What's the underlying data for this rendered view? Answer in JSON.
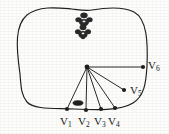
{
  "figure": {
    "kind": "geometry-diagram",
    "background_color": "#fdfdfc",
    "ink_color": "#1f1f1f",
    "outline": {
      "name": "region-outline",
      "path": "M 20 74 C 16 46 15 25 27 15 C 40 5 60 8 72 9 C 80 10 86 11 92 10 C 104 8 122 6 134 12 C 147 19 148 42 147 66 C 146 84 144 96 133 103 C 120 111 96 110 74 109 C 56 108 34 110 27 102 C 21 95 21 86 20 74 Z"
    },
    "hub": {
      "name": "hub-vertex",
      "x": 87,
      "y": 67,
      "radius": 2.4
    },
    "vertices": [
      {
        "id": "V1",
        "label": "V",
        "sub": "1",
        "x": 67,
        "y": 109,
        "label_x": 60,
        "label_y": 116
      },
      {
        "id": "V2",
        "label": "V",
        "sub": "2",
        "x": 86,
        "y": 110,
        "label_x": 78,
        "label_y": 116
      },
      {
        "id": "V3",
        "label": "V",
        "sub": "3",
        "x": 101,
        "y": 109,
        "label_x": 94,
        "label_y": 116
      },
      {
        "id": "V4",
        "label": "V",
        "sub": "4",
        "x": 115,
        "y": 108,
        "label_x": 108,
        "label_y": 116
      },
      {
        "id": "V5",
        "label": "V",
        "sub": "5",
        "x": 124,
        "y": 90,
        "label_x": 130,
        "label_y": 85
      },
      {
        "id": "V6",
        "label": "V",
        "sub": "6",
        "x": 143,
        "y": 67,
        "label_x": 148,
        "label_y": 60
      }
    ],
    "edges": [
      {
        "name": "edge-hub-v1",
        "from": "hub",
        "to": "V1"
      },
      {
        "name": "edge-hub-v2",
        "from": "hub",
        "to": "V2"
      },
      {
        "name": "edge-hub-v3",
        "from": "hub",
        "to": "V3"
      },
      {
        "name": "edge-hub-v4",
        "from": "hub",
        "to": "V4"
      },
      {
        "name": "edge-hub-v5",
        "from": "hub",
        "to": "V5"
      },
      {
        "name": "edge-hub-v6",
        "from": "hub",
        "to": "V6"
      }
    ],
    "obstacles": [
      {
        "name": "obstacle-blob-upper",
        "cx": 84,
        "cy": 20,
        "rx": 7,
        "ry": 5.5
      },
      {
        "name": "obstacle-blob-lower",
        "cx": 83,
        "cy": 32,
        "rx": 6.5,
        "ry": 5.5
      },
      {
        "name": "obstacle-blob-bottom",
        "cx": 78,
        "cy": 103,
        "rx": 5,
        "ry": 2.3
      }
    ]
  }
}
